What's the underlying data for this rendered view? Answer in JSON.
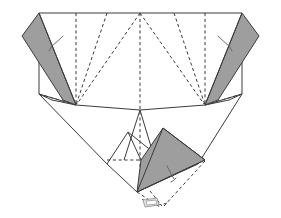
{
  "figure": {
    "background_color": "#ffffff",
    "width": 281,
    "height": 218,
    "line_color": "#3c3c3c",
    "flap_fill_color": "#9e9e9e",
    "white_face_color": "#ffffff",
    "arc_color": "#6b6b6b",
    "glyph_color": "#8a8a8a"
  },
  "shapes": {
    "base_outline": {
      "name": "paper-base-outline",
      "points": "39,13 242,13 242,94 229,105 198,164 152,192 107,164 76,105 39,94",
      "description": "Main folded paper silhouette"
    },
    "top_edge": {
      "name": "top-edge",
      "points": "39,13 242,13"
    },
    "left_side_edge": {
      "name": "left-side-edge",
      "points": "39,13 39,94"
    },
    "right_side_edge": {
      "name": "right-side-edge",
      "points": "242,13 242,94"
    },
    "left_flap": {
      "name": "left-gray-flap",
      "points": "39,13 76,105 63,100 22,36",
      "fill": "#9e9e9e"
    },
    "right_flap": {
      "name": "right-gray-flap",
      "points": "242,13 205,105 218,100 259,36",
      "fill": "#9e9e9e"
    },
    "bottom_flap": {
      "name": "bottom-gray-flap",
      "points": "163,128 205,160 137,192 141,160",
      "fill": "#9e9e9e"
    },
    "left_inner_panel": {
      "name": "left-inner-panel",
      "points": "39,94 76,105 140,110 107,164"
    },
    "right_inner_panel": {
      "name": "right-inner-panel",
      "points": "242,94 205,105 140,110 198,164"
    },
    "center_peak": {
      "name": "center-peak-panel",
      "points": "140,110 124,160 155,160"
    },
    "left_lower_fold": {
      "name": "left-lower-fold-panel",
      "points": "107,164 128,132 141,160"
    }
  },
  "creases": {
    "vertical_dashes": [
      {
        "name": "crease-vertical-left",
        "x": 76,
        "y1": 13,
        "y2": 105
      },
      {
        "name": "crease-vertical-center",
        "x": 140,
        "y1": 13,
        "y2": 192
      },
      {
        "name": "crease-vertical-right",
        "x": 205,
        "y1": 13,
        "y2": 105
      }
    ],
    "diagonal_dashes": [
      {
        "name": "crease-diag-left-outer",
        "points": "39,94 76,105"
      },
      {
        "name": "crease-diag-left-upper",
        "points": "107,13 76,105"
      },
      {
        "name": "crease-diag-left-to-center",
        "points": "140,13 76,105"
      },
      {
        "name": "crease-diag-right-upper",
        "points": "174,13 205,105"
      },
      {
        "name": "crease-diag-right-to-center",
        "points": "140,13 205,105"
      },
      {
        "name": "crease-diag-right-outer",
        "points": "242,94 205,105"
      }
    ],
    "horizontal_dash": {
      "name": "crease-horizontal-lower",
      "points": "107,160 205,160"
    },
    "bottom_dashes": [
      {
        "name": "crease-bottom-left-ray",
        "points": "137,192 162,205"
      },
      {
        "name": "crease-bottom-mid-ray",
        "points": "150,192 162,205"
      },
      {
        "name": "crease-bottom-right-ray",
        "points": "205,160 162,205"
      },
      {
        "name": "crease-bottom-arc-base",
        "points": "143,200 162,206 180,196"
      }
    ]
  },
  "annotations": {
    "fold_arcs": [
      {
        "name": "fold-arc-left",
        "path": "M 52,45 Q 59,41 62,37"
      },
      {
        "name": "fold-arc-left-tail",
        "path": "M 50,50 Q 52,47 53,44"
      },
      {
        "name": "fold-arc-right",
        "path": "M 229,45 Q 222,41 219,37"
      },
      {
        "name": "fold-arc-right-tail",
        "path": "M 231,50 Q 229,47 228,44"
      },
      {
        "name": "fold-arc-bottom",
        "path": "M 168,166 Q 171,175 175,180"
      },
      {
        "name": "fold-arc-bottom-tail",
        "path": "M 172,182 Q 174,181 176,179"
      }
    ],
    "turn_over_glyph": {
      "name": "turn-over-glyph",
      "label": "",
      "outline": "143,200 157,198 159,205 145,207",
      "inner": "146,201 156,200 157,204 147,205"
    }
  },
  "labels": {
    "caption": ""
  }
}
